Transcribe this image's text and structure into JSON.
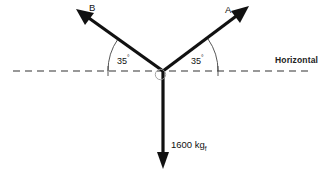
{
  "diagram": {
    "type": "free-body-force-diagram",
    "canvas": {
      "width": 320,
      "height": 172,
      "background": "#ffffff"
    },
    "stroke_color": "#111111",
    "reference_color": "#333333",
    "vertex": {
      "x": 163,
      "y": 71
    },
    "vectors": [
      {
        "name": "A",
        "label": "A",
        "direction": "up-right",
        "angle_from_horizontal_deg": 35,
        "tip": {
          "x": 248,
          "y": 7
        },
        "label_position": {
          "x": 225,
          "y": 5
        }
      },
      {
        "name": "B",
        "label": "B",
        "direction": "up-left",
        "angle_from_horizontal_deg": 35,
        "tip": {
          "x": 77,
          "y": 10
        },
        "label_position": {
          "x": 89,
          "y": 3
        }
      },
      {
        "name": "W",
        "label": "1600 kg",
        "label_subscript": "f",
        "direction": "down",
        "angle_from_horizontal_deg": 90,
        "tip": {
          "x": 163,
          "y": 168
        },
        "label_position": {
          "x": 171,
          "y": 140
        }
      }
    ],
    "angles": [
      {
        "name": "angle-left",
        "value": "35",
        "unit": "°",
        "between": "B and horizontal"
      },
      {
        "name": "angle-right",
        "value": "35",
        "unit": "°",
        "between": "A and horizontal"
      }
    ],
    "reference_line": {
      "label": "Horizontal",
      "style": "dashed",
      "y": 71,
      "x_start": 13,
      "x_end": 313
    }
  }
}
